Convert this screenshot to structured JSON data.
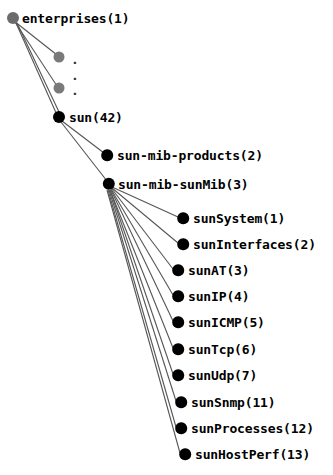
{
  "diagram": {
    "type": "tree",
    "title": "",
    "orientation": "top-left-to-bottom-right",
    "colors": {
      "root_node": "#6b6b6b",
      "placeholder_node": "#7a7a7a",
      "node": "#000000",
      "edge": "#555555",
      "background": "#ffffff",
      "label": "#000000"
    },
    "nodes": [
      {
        "id": "enterprises",
        "label": "enterprises(1)",
        "x": 13,
        "y": 18,
        "r": 6.0,
        "fill": "#6b6b6b",
        "label_x": 22,
        "label_y": 18
      },
      {
        "id": "dot1",
        "label": ".",
        "x": 59,
        "y": 57,
        "r": 5.5,
        "fill": "#7a7a7a",
        "label_x": 71,
        "label_y": 59
      },
      {
        "id": "dotmid",
        "label": ".",
        "x": null,
        "y": null,
        "r": 0,
        "fill": "transparent",
        "label_x": 71,
        "label_y": 75
      },
      {
        "id": "dot2",
        "label": ".",
        "x": 59,
        "y": 88,
        "r": 5.5,
        "fill": "#7a7a7a",
        "label_x": 71,
        "label_y": 90
      },
      {
        "id": "sun",
        "label": "sun(42)",
        "x": 59,
        "y": 117,
        "r": 6.0,
        "fill": "#000000",
        "label_x": 69,
        "label_y": 117
      },
      {
        "id": "products",
        "label": "sun-mib-products(2)",
        "x": 107,
        "y": 155,
        "r": 5.8,
        "fill": "#000000",
        "label_x": 117,
        "label_y": 155
      },
      {
        "id": "sunmib",
        "label": "sun-mib-sunMib(3)",
        "x": 109,
        "y": 184,
        "r": 6.2,
        "fill": "#000000",
        "label_x": 118,
        "label_y": 184
      },
      {
        "id": "sunSystem",
        "label": "sunSystem(1)",
        "x": 183,
        "y": 218,
        "r": 5.8,
        "fill": "#000000",
        "label_x": 193,
        "label_y": 218
      },
      {
        "id": "sunInterfaces",
        "label": "sunInterfaces(2)",
        "x": 183,
        "y": 244,
        "r": 5.8,
        "fill": "#000000",
        "label_x": 193,
        "label_y": 244
      },
      {
        "id": "sunAT",
        "label": "sunAT(3)",
        "x": 178,
        "y": 270,
        "r": 5.8,
        "fill": "#000000",
        "label_x": 188,
        "label_y": 270
      },
      {
        "id": "sunIP",
        "label": "sunIP(4)",
        "x": 178,
        "y": 296,
        "r": 5.8,
        "fill": "#000000",
        "label_x": 188,
        "label_y": 296
      },
      {
        "id": "sunICMP",
        "label": "sunICMP(5)",
        "x": 178,
        "y": 322,
        "r": 5.8,
        "fill": "#000000",
        "label_x": 188,
        "label_y": 322
      },
      {
        "id": "sunTcp",
        "label": "sunTcp(6)",
        "x": 178,
        "y": 349,
        "r": 5.8,
        "fill": "#000000",
        "label_x": 188,
        "label_y": 349
      },
      {
        "id": "sunUdp",
        "label": "sunUdp(7)",
        "x": 178,
        "y": 375,
        "r": 5.8,
        "fill": "#000000",
        "label_x": 188,
        "label_y": 375
      },
      {
        "id": "sunSnmp",
        "label": "sunSnmp(11)",
        "x": 181,
        "y": 402,
        "r": 5.8,
        "fill": "#000000",
        "label_x": 191,
        "label_y": 402
      },
      {
        "id": "sunProcesses",
        "label": "sunProcesses(12)",
        "x": 181,
        "y": 428,
        "r": 5.8,
        "fill": "#000000",
        "label_x": 191,
        "label_y": 428
      },
      {
        "id": "sunHostPerf",
        "label": "sunHostPerf(13)",
        "x": 185,
        "y": 454,
        "r": 5.8,
        "fill": "#000000",
        "label_x": 195,
        "label_y": 454
      }
    ],
    "edges": [
      {
        "from": "enterprises",
        "to": "dot1"
      },
      {
        "from": "enterprises",
        "to": "dot2"
      },
      {
        "from": "enterprises",
        "to": "sun"
      },
      {
        "from": "enterprises",
        "to": "sun_alt"
      },
      {
        "from": "sun",
        "to": "products"
      },
      {
        "from": "sun",
        "to": "sunmib"
      },
      {
        "from": "sunmib",
        "to": "sunSystem"
      },
      {
        "from": "sunmib",
        "to": "sunInterfaces"
      },
      {
        "from": "sunmib",
        "to": "sunAT"
      },
      {
        "from": "sunmib",
        "to": "sunIP"
      },
      {
        "from": "sunmib",
        "to": "sunICMP"
      },
      {
        "from": "sunmib",
        "to": "sunTcp"
      },
      {
        "from": "sunmib",
        "to": "sunUdp"
      },
      {
        "from": "sunmib",
        "to": "sunSnmp"
      },
      {
        "from": "sunmib",
        "to": "sunProcesses"
      },
      {
        "from": "sunmib",
        "to": "sunHostPerf"
      }
    ]
  }
}
